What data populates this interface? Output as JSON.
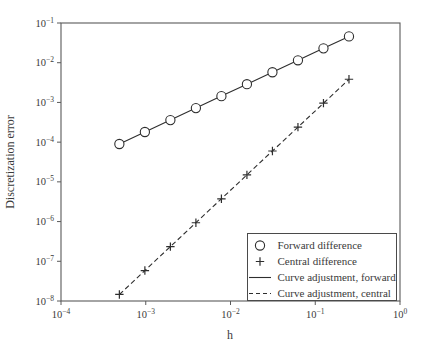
{
  "figure": {
    "background": "#ffffff"
  },
  "colors": {
    "data_stroke": "#2e2e2e",
    "frame_stroke": "#5a5a5a",
    "text": "#3a3a3a",
    "marker_fill": "#ffffff",
    "legend_border": "#4a4a4a"
  },
  "chart_data": {
    "type": "line",
    "title": "",
    "xlabel": "h",
    "ylabel": "Discretization error",
    "x_scale": "log",
    "y_scale": "log",
    "xlim": [
      0.0001,
      1
    ],
    "ylim": [
      1e-08,
      0.1
    ],
    "x_log_range": [
      -4,
      0
    ],
    "y_log_range": [
      -8,
      -1
    ],
    "x_tick_exponents": [
      -4,
      -3,
      -2,
      -1,
      0
    ],
    "y_tick_exponents": [
      -1,
      -2,
      -3,
      -4,
      -5,
      -6,
      -7,
      -8
    ],
    "grid": false,
    "x": [
      0.00048828125,
      0.0009765625,
      0.001953125,
      0.00390625,
      0.0078125,
      0.015625,
      0.03125,
      0.0625,
      0.125,
      0.25
    ],
    "series": [
      {
        "name": "Forward difference",
        "marker": "circle",
        "line": "none",
        "values": [
          8.98e-05,
          0.00018,
          0.000359,
          0.000719,
          0.00144,
          0.00288,
          0.00575,
          0.0115,
          0.023,
          0.046
        ]
      },
      {
        "name": "Central difference",
        "marker": "plus",
        "line": "none",
        "values": [
          1.46e-08,
          5.85e-08,
          2.34e-07,
          9.35e-07,
          3.74e-06,
          1.5e-05,
          5.99e-05,
          0.000239,
          0.000958,
          0.00383
        ]
      },
      {
        "name": "Curve adjustment, forward",
        "marker": "none",
        "line": "solid",
        "values": [
          8.98e-05,
          0.00018,
          0.000359,
          0.000719,
          0.00144,
          0.00288,
          0.00575,
          0.0115,
          0.023,
          0.046
        ]
      },
      {
        "name": "Curve adjustment, central",
        "marker": "none",
        "line": "dashed",
        "values": [
          1.46e-08,
          5.85e-08,
          2.34e-07,
          9.35e-07,
          3.74e-06,
          1.5e-05,
          5.99e-05,
          0.000239,
          0.000958,
          0.00383
        ]
      }
    ],
    "legend": {
      "position": "lower right",
      "entries": [
        "Forward difference",
        "Central difference",
        "Curve adjustment, forward",
        "Curve adjustment, central"
      ]
    }
  }
}
